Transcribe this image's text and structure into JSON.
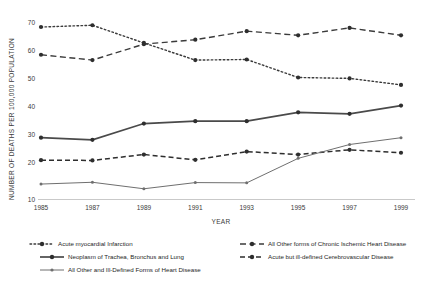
{
  "chart_data": {
    "type": "line",
    "title": "",
    "xlabel": "YEAR",
    "ylabel": "NUMBER OF DEATHS PER 100,000 POPULATION",
    "x": [
      1985,
      1987,
      1989,
      1991,
      1993,
      1995,
      1997,
      1999
    ],
    "xticklabels": [
      "1985",
      "1987",
      "1989",
      "1991",
      "1993",
      "1995",
      "1997",
      "1999"
    ],
    "yticklabels": [
      "10",
      "20",
      "30",
      "40",
      "50",
      "60",
      "70"
    ],
    "yticks": [
      10,
      20,
      30,
      40,
      50,
      60,
      70
    ],
    "ylim": [
      10,
      72
    ],
    "xlim": [
      1985,
      1999
    ],
    "grid": false,
    "legend_position": "below-plot",
    "series": [
      {
        "name": "Acute myocardial Infarction",
        "style": "dotted",
        "color": "#3b3b3b",
        "values": [
          68.4,
          69.0,
          63.0,
          57.2,
          57.4,
          51.3,
          51.0,
          48.8
        ]
      },
      {
        "name": "All Other forms of Chronic Ischemic Heart Disease",
        "style": "dashed",
        "color": "#3b3b3b",
        "values": [
          59.0,
          57.2,
          62.6,
          64.1,
          67.0,
          65.6,
          68.1,
          65.6
        ]
      },
      {
        "name": "Neoplasm of Trachea, Bronchus and Lung",
        "style": "solid-thick",
        "color": "#4a4a4a",
        "values": [
          30.9,
          30.2,
          35.7,
          36.5,
          36.5,
          39.5,
          39.0,
          41.8
        ]
      },
      {
        "name": "Acute but ill-defined Cerebrovascular Disease",
        "style": "dashed",
        "color": "#2e2e2e",
        "values": [
          23.3,
          23.2,
          25.2,
          23.4,
          26.2,
          25.2,
          26.8,
          25.8
        ]
      },
      {
        "name": "All Other and Ill-Defined Forms of Heart Disease",
        "style": "solid-thin",
        "color": "#6f6f6f",
        "values": [
          15.2,
          15.8,
          13.6,
          15.7,
          15.6,
          23.9,
          28.6,
          30.9
        ]
      }
    ]
  },
  "legend": {
    "items": [
      {
        "label": "Acute myocardial Infarction",
        "marker": "dotted-marker-icon"
      },
      {
        "label": "All Other forms of Chronic Ischemic Heart Disease",
        "marker": "dashed-marker-icon"
      },
      {
        "label": "Neoplasm of Trachea, Bronchus and Lung",
        "marker": "solid-thick-marker-icon"
      },
      {
        "label": "Acute but ill-defined Cerebrovascular Disease",
        "marker": "dashed-marker-icon"
      },
      {
        "label": "All Other and Ill-Defined Forms of Heart Disease",
        "marker": "solid-thin-marker-icon"
      }
    ]
  }
}
